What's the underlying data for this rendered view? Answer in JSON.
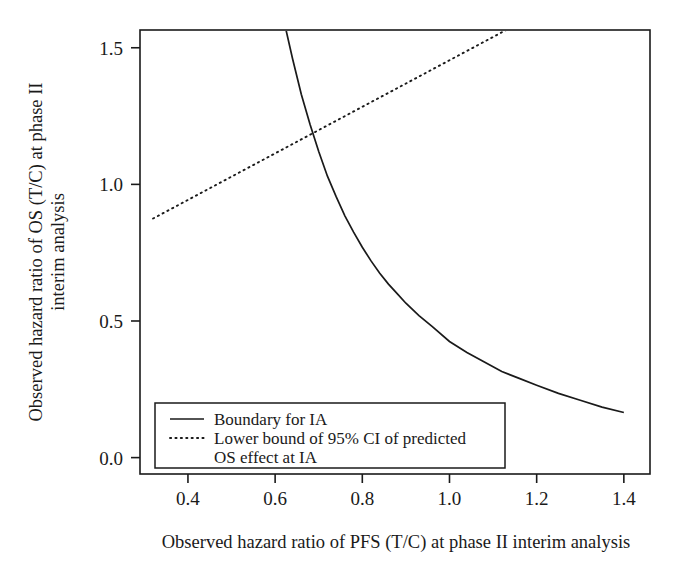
{
  "chart_data": {
    "type": "line",
    "title": "",
    "xlabel": "Observed hazard ratio of PFS (T/C) at phase II interim analysis",
    "ylabel_line1": "Observed hazard ratio of OS (T/C) at phase II",
    "ylabel_line2": "interim analysis",
    "xlim": [
      0.29,
      1.46
    ],
    "ylim": [
      -0.06,
      1.565
    ],
    "xticks": [
      0.4,
      0.6,
      0.8,
      1.0,
      1.2,
      1.4
    ],
    "xtick_labels": [
      "0.4",
      "0.6",
      "0.8",
      "1.0",
      "1.2",
      "1.4"
    ],
    "yticks": [
      0.0,
      0.5,
      1.0,
      1.5
    ],
    "ytick_labels": [
      "0.0",
      "0.5",
      "1.0",
      "1.5"
    ],
    "grid": false,
    "legend_position": "bottom-left",
    "series": [
      {
        "name": "Boundary for IA",
        "style": "solid",
        "color": "#1a1a1a",
        "x": [
          0.625,
          0.64,
          0.66,
          0.68,
          0.7,
          0.72,
          0.74,
          0.76,
          0.78,
          0.8,
          0.82,
          0.84,
          0.86,
          0.88,
          0.9,
          0.93,
          0.96,
          1.0,
          1.04,
          1.08,
          1.12,
          1.16,
          1.2,
          1.25,
          1.3,
          1.35,
          1.4
        ],
        "y": [
          1.565,
          1.46,
          1.33,
          1.22,
          1.12,
          1.03,
          0.955,
          0.885,
          0.825,
          0.77,
          0.72,
          0.675,
          0.635,
          0.6,
          0.565,
          0.52,
          0.48,
          0.425,
          0.385,
          0.35,
          0.315,
          0.29,
          0.265,
          0.235,
          0.21,
          0.185,
          0.165
        ]
      },
      {
        "name": "Lower bound of 95% CI of predicted OS effect at IA",
        "style": "dotted",
        "color": "#1a1a1a",
        "x": [
          0.32,
          1.13
        ],
        "y": [
          0.875,
          1.565
        ]
      }
    ],
    "legend_entries": [
      {
        "label": "Boundary for IA",
        "style": "solid"
      },
      {
        "label_line1": "Lower bound of 95% CI of predicted",
        "label_line2": "OS effect at IA",
        "style": "dotted"
      }
    ]
  }
}
